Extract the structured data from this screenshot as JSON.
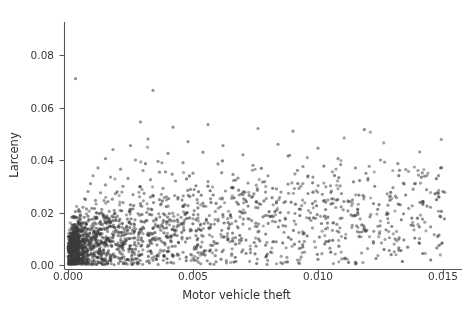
{
  "chart_data": {
    "type": "scatter",
    "title": "",
    "xlabel": "Motor vehicle theft",
    "ylabel": "Larceny",
    "xlim": [
      -0.0005,
      0.0158
    ],
    "ylim": [
      -0.004,
      0.0875
    ],
    "xticks": [
      0.0,
      0.005,
      0.01,
      0.015
    ],
    "xticklabels": [
      "0.000",
      "0.005",
      "0.010",
      "0.015"
    ],
    "yticks": [
      0.0,
      0.02,
      0.04,
      0.06,
      0.08
    ],
    "yticklabels": [
      "0.00",
      "0.02",
      "0.04",
      "0.06",
      "0.08"
    ],
    "grid": false,
    "legend": null,
    "marker": {
      "color": "#4d4d4d",
      "size": 1.6,
      "alpha": 0.55,
      "shape": "circle"
    },
    "spines": {
      "left": true,
      "bottom": true,
      "top": false,
      "right": false
    },
    "n_points": 1900,
    "points": [
      [
        0.0003,
        0.071
      ],
      [
        0.0034,
        0.0665
      ],
      [
        0.0029,
        0.0545
      ],
      [
        0.0042,
        0.0525
      ],
      [
        0.0056,
        0.0535
      ],
      [
        0.0076,
        0.052
      ],
      [
        0.009,
        0.051
      ],
      [
        0.0032,
        0.048
      ],
      [
        0.0025,
        0.0455
      ],
      [
        0.0048,
        0.047
      ],
      [
        0.0062,
        0.0455
      ],
      [
        0.0084,
        0.046
      ],
      [
        0.01,
        0.0445
      ],
      [
        0.0018,
        0.044
      ],
      [
        0.004,
        0.0425
      ],
      [
        0.0054,
        0.043
      ],
      [
        0.007,
        0.042
      ],
      [
        0.0088,
        0.0415
      ],
      [
        0.0108,
        0.0405
      ],
      [
        0.0125,
        0.04
      ],
      [
        0.0015,
        0.0405
      ],
      [
        0.0027,
        0.04
      ],
      [
        0.0036,
        0.0395
      ],
      [
        0.0046,
        0.039
      ],
      [
        0.006,
        0.0385
      ],
      [
        0.0074,
        0.038
      ],
      [
        0.0094,
        0.0375
      ],
      [
        0.0115,
        0.037
      ],
      [
        0.014,
        0.036
      ],
      [
        0.0012,
        0.037
      ],
      [
        0.0021,
        0.0365
      ],
      [
        0.003,
        0.036
      ],
      [
        0.0039,
        0.0355
      ],
      [
        0.005,
        0.035
      ],
      [
        0.0066,
        0.0345
      ],
      [
        0.008,
        0.034
      ],
      [
        0.0098,
        0.0335
      ],
      [
        0.012,
        0.033
      ],
      [
        0.001,
        0.034
      ],
      [
        0.0017,
        0.0335
      ],
      [
        0.0024,
        0.033
      ],
      [
        0.0033,
        0.0325
      ],
      [
        0.0043,
        0.032
      ],
      [
        0.0056,
        0.0318
      ],
      [
        0.0072,
        0.0312
      ],
      [
        0.0088,
        0.0308
      ],
      [
        0.0105,
        0.0302
      ],
      [
        0.013,
        0.0295
      ],
      [
        0.0009,
        0.031
      ],
      [
        0.0015,
        0.0305
      ],
      [
        0.0022,
        0.03
      ],
      [
        0.0029,
        0.0298
      ],
      [
        0.0038,
        0.0292
      ],
      [
        0.0049,
        0.0288
      ],
      [
        0.0063,
        0.0282
      ],
      [
        0.0079,
        0.0278
      ],
      [
        0.0096,
        0.0272
      ],
      [
        0.0118,
        0.0265
      ],
      [
        0.0145,
        0.022
      ],
      [
        0.0008,
        0.028
      ],
      [
        0.0013,
        0.0275
      ],
      [
        0.0019,
        0.0272
      ],
      [
        0.0026,
        0.0268
      ],
      [
        0.0034,
        0.0262
      ],
      [
        0.0044,
        0.0258
      ],
      [
        0.0057,
        0.0252
      ],
      [
        0.0071,
        0.0248
      ],
      [
        0.0087,
        0.0242
      ],
      [
        0.0106,
        0.0235
      ],
      [
        0.0128,
        0.0228
      ],
      [
        0.0007,
        0.025
      ],
      [
        0.0011,
        0.0246
      ],
      [
        0.0016,
        0.0242
      ],
      [
        0.0022,
        0.0238
      ],
      [
        0.0029,
        0.0234
      ],
      [
        0.0037,
        0.023
      ],
      [
        0.0048,
        0.0226
      ],
      [
        0.0061,
        0.0222
      ],
      [
        0.0076,
        0.0218
      ],
      [
        0.0093,
        0.0212
      ],
      [
        0.0112,
        0.0206
      ],
      [
        0.0006,
        0.022
      ],
      [
        0.00095,
        0.0216
      ],
      [
        0.00135,
        0.0212
      ],
      [
        0.00185,
        0.0208
      ],
      [
        0.00245,
        0.0204
      ],
      [
        0.00315,
        0.02
      ],
      [
        0.00405,
        0.0196
      ],
      [
        0.0052,
        0.0192
      ],
      [
        0.0065,
        0.0188
      ],
      [
        0.0081,
        0.0184
      ],
      [
        0.0099,
        0.0178
      ],
      [
        0.0005,
        0.019
      ],
      [
        0.0008,
        0.0186
      ],
      [
        0.00115,
        0.0182
      ],
      [
        0.00158,
        0.0178
      ],
      [
        0.00208,
        0.0175
      ],
      [
        0.00268,
        0.0172
      ],
      [
        0.00342,
        0.0168
      ],
      [
        0.0044,
        0.0164
      ],
      [
        0.0056,
        0.016
      ],
      [
        0.007,
        0.0156
      ],
      [
        0.0086,
        0.015
      ],
      [
        0.00045,
        0.0165
      ],
      [
        0.0007,
        0.0162
      ],
      [
        0.001,
        0.0158
      ],
      [
        0.00138,
        0.0155
      ],
      [
        0.00182,
        0.0152
      ],
      [
        0.00235,
        0.0148
      ],
      [
        0.003,
        0.0144
      ],
      [
        0.00385,
        0.014
      ],
      [
        0.0049,
        0.0136
      ],
      [
        0.00615,
        0.0132
      ],
      [
        0.0076,
        0.0126
      ],
      [
        0.0004,
        0.014
      ],
      [
        0.00062,
        0.0137
      ],
      [
        0.00088,
        0.0134
      ],
      [
        0.0012,
        0.0131
      ],
      [
        0.00158,
        0.0128
      ],
      [
        0.00205,
        0.0125
      ],
      [
        0.00262,
        0.0121
      ],
      [
        0.00335,
        0.0118
      ],
      [
        0.00428,
        0.0114
      ],
      [
        0.0054,
        0.011
      ],
      [
        0.0067,
        0.0104
      ],
      [
        0.00035,
        0.0118
      ],
      [
        0.00054,
        0.0115
      ],
      [
        0.00076,
        0.0112
      ],
      [
        0.00104,
        0.0109
      ],
      [
        0.00137,
        0.0106
      ],
      [
        0.00178,
        0.0103
      ],
      [
        0.00228,
        0.01
      ],
      [
        0.00292,
        0.0096
      ],
      [
        0.00372,
        0.0092
      ],
      [
        0.0047,
        0.0088
      ],
      [
        0.0059,
        0.0082
      ],
      [
        0.0003,
        0.0095
      ],
      [
        0.00046,
        0.0092
      ],
      [
        0.00065,
        0.0089
      ],
      [
        0.00089,
        0.0086
      ],
      [
        0.00117,
        0.0083
      ],
      [
        0.00152,
        0.008
      ],
      [
        0.00195,
        0.0077
      ],
      [
        0.0025,
        0.0074
      ],
      [
        0.00318,
        0.007
      ],
      [
        0.00402,
        0.0066
      ],
      [
        0.00505,
        0.006
      ],
      [
        0.00025,
        0.0072
      ],
      [
        0.00038,
        0.0069
      ],
      [
        0.00054,
        0.0066
      ],
      [
        0.00074,
        0.0063
      ],
      [
        0.00097,
        0.006
      ],
      [
        0.00126,
        0.0058
      ],
      [
        0.00162,
        0.0055
      ],
      [
        0.00207,
        0.0052
      ],
      [
        0.00264,
        0.0048
      ],
      [
        0.00334,
        0.0044
      ],
      [
        0.0042,
        0.0038
      ],
      [
        0.0002,
        0.0048
      ],
      [
        0.00031,
        0.0045
      ],
      [
        0.00044,
        0.0043
      ],
      [
        0.0006,
        0.004
      ],
      [
        0.00079,
        0.0038
      ],
      [
        0.00102,
        0.0035
      ],
      [
        0.00131,
        0.0032
      ],
      [
        0.00168,
        0.0029
      ],
      [
        0.00214,
        0.0026
      ],
      [
        0.00271,
        0.0022
      ],
      [
        0.0034,
        0.0018
      ],
      [
        0.00015,
        0.0025
      ],
      [
        0.00023,
        0.0022
      ],
      [
        0.00033,
        0.002
      ],
      [
        0.00045,
        0.0018
      ],
      [
        0.00059,
        0.0016
      ],
      [
        0.00076,
        0.0014
      ],
      [
        0.00098,
        0.0012
      ],
      [
        0.00125,
        0.001
      ],
      [
        0.00159,
        0.0008
      ],
      [
        0.00202,
        0.0006
      ],
      [
        0.00255,
        0.0004
      ],
      [
        0.0001,
        0.001
      ],
      [
        0.00016,
        0.0008
      ],
      [
        0.00023,
        0.0007
      ],
      [
        0.00032,
        0.0006
      ],
      [
        0.00042,
        0.0005
      ],
      [
        0.00055,
        0.0004
      ],
      [
        0.0007,
        0.0003
      ],
      [
        0.0009,
        0.0002
      ],
      [
        0.00115,
        0.0002
      ],
      [
        0.00146,
        0.0001
      ],
      [
        0.00185,
        0.0001
      ]
    ]
  }
}
